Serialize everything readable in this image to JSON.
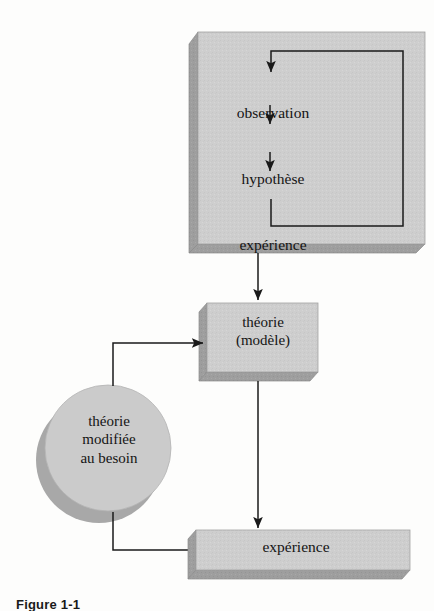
{
  "figure": {
    "caption": "Figure 1-1",
    "language": "fr"
  },
  "colors": {
    "box_fill": "#cecece",
    "box_shadow": "#9a9a9a",
    "box_stroke": "#8f8f8f",
    "circle_fill": "#c9c9c9",
    "circle_shadow": "#a3a3a3",
    "line": "#1a1a1a",
    "text": "#141414",
    "background": "#fdfdfc"
  },
  "nodes": {
    "cycle_box": {
      "name": "cycle-box",
      "steps": [
        {
          "label": "observation"
        },
        {
          "label": "hypothèse"
        },
        {
          "label": "expérience"
        }
      ]
    },
    "theorie_box": {
      "name": "theorie-box",
      "label": "théorie\n(modèle)"
    },
    "theorie_modifiee_circle": {
      "name": "theorie-modifiee-circle",
      "label": "théorie\nmodifiée\nau besoin"
    },
    "experience_box": {
      "name": "experience-box",
      "label": "expérience"
    }
  },
  "edges": [
    {
      "name": "observation-to-hypothese",
      "from": "observation",
      "to": "hypothèse",
      "style": "arrow-down"
    },
    {
      "name": "hypothese-to-experience",
      "from": "hypothèse",
      "to": "expérience",
      "style": "arrow-down"
    },
    {
      "name": "experience-feedback-loop",
      "from": "expérience",
      "to": "observation",
      "style": "loop-right-up"
    },
    {
      "name": "cycle-to-theorie",
      "from": "cycle-box",
      "to": "théorie (modèle)",
      "style": "arrow-down"
    },
    {
      "name": "theorie-to-experience",
      "from": "théorie (modèle)",
      "to": "expérience",
      "style": "arrow-down"
    },
    {
      "name": "experience-to-theorie-modifiee",
      "from": "expérience",
      "to": "théorie modifiée au besoin",
      "style": "left-up"
    },
    {
      "name": "theorie-modifiee-to-theorie",
      "from": "théorie modifiée au besoin",
      "to": "théorie (modèle)",
      "style": "up-right-arrow"
    }
  ]
}
